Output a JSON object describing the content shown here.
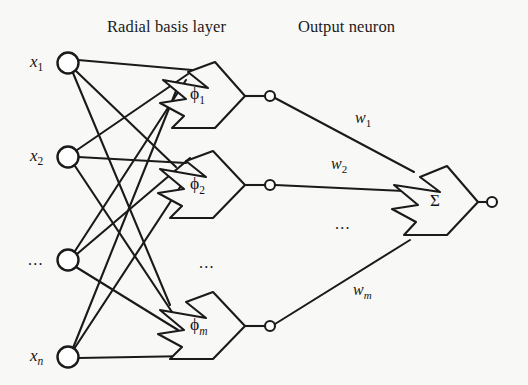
{
  "figure": {
    "background_color": "#f8f8f7",
    "stroke_color": "#1a1a1a",
    "node_fill": "#ffffff"
  },
  "headers": [
    {
      "id": "radial-basis-layer",
      "text": "Radial basis layer",
      "x": 107,
      "y": 17
    },
    {
      "id": "output-neuron",
      "text": "Output neuron",
      "x": 298,
      "y": 17
    }
  ],
  "input_layer": {
    "name": "input-nodes",
    "node_radius": 10.5,
    "nodes": [
      {
        "id": "x1",
        "label": "x",
        "sub": "1",
        "sub_italic": false,
        "cx": 68,
        "cy": 63,
        "label_x": 30,
        "label_y": 53
      },
      {
        "id": "x2",
        "label": "x",
        "sub": "2",
        "sub_italic": false,
        "cx": 68,
        "cy": 157,
        "label_x": 30,
        "label_y": 147
      },
      {
        "id": "xdots",
        "label": "...",
        "sub": "",
        "sub_italic": false,
        "cx": 68,
        "cy": 260,
        "label_x": 28,
        "label_y": 252
      },
      {
        "id": "xn",
        "label": "x",
        "sub": "n",
        "sub_italic": true,
        "cx": 68,
        "cy": 357,
        "label_x": 30,
        "label_y": 347
      }
    ]
  },
  "hidden_layer": {
    "name": "radial-basis-neurons",
    "neurons": [
      {
        "id": "phi1",
        "label": "ϕ",
        "sub": "1",
        "sub_italic": false,
        "tip_x": 245,
        "tip_y": 96,
        "label_x": 190,
        "label_y": 85,
        "out_cx": 270,
        "out_cy": 96
      },
      {
        "id": "phi2",
        "label": "ϕ",
        "sub": "2",
        "sub_italic": false,
        "tip_x": 245,
        "tip_y": 185,
        "label_x": 190,
        "label_y": 175,
        "out_cx": 270,
        "out_cy": 185
      },
      {
        "id": "phim",
        "label": "ϕ",
        "sub": "m",
        "sub_italic": true,
        "tip_x": 245,
        "tip_y": 326,
        "label_x": 190,
        "label_y": 316,
        "out_cx": 270,
        "out_cy": 326
      }
    ],
    "ellipsis": {
      "id": "hidden-ellipsis",
      "text": "...",
      "x": 199,
      "y": 255
    },
    "out_node_radius": 5
  },
  "output_layer": {
    "name": "summation-neuron",
    "label": "Σ",
    "label_x": 430,
    "label_y": 192,
    "tip_x": 478,
    "tip_y": 202,
    "out_cx": 492,
    "out_cy": 202,
    "out_node_radius": 5,
    "ellipsis": {
      "id": "output-ellipsis",
      "text": "...",
      "x": 335,
      "y": 216
    }
  },
  "weights": [
    {
      "id": "w1",
      "label": "w",
      "sub": "1",
      "sub_italic": false,
      "x": 355,
      "y": 110
    },
    {
      "id": "w2",
      "label": "w",
      "sub": "2",
      "sub_italic": false,
      "x": 331,
      "y": 156
    },
    {
      "id": "wm",
      "label": "w",
      "sub": "m",
      "sub_italic": true,
      "x": 353,
      "y": 282
    }
  ],
  "connections": {
    "input_to_hidden": "fully-connected",
    "hidden_to_output": "weighted"
  }
}
